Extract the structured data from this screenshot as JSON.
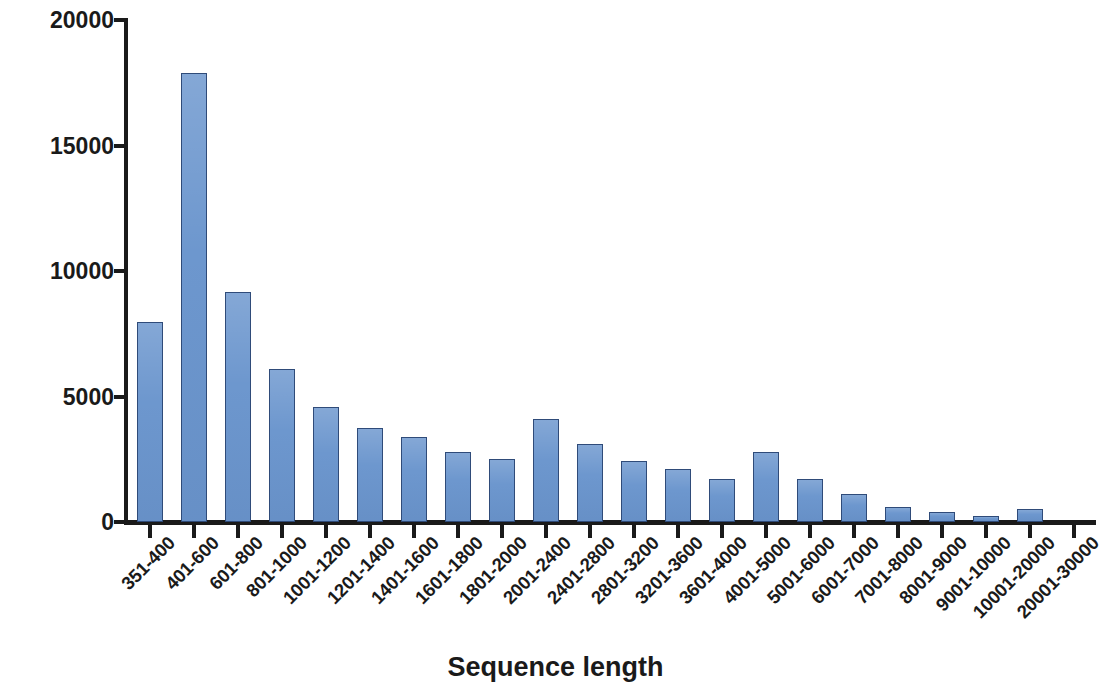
{
  "chart_data": {
    "type": "bar",
    "title": "",
    "xlabel": "Sequence length",
    "ylabel": "Sequence number",
    "ylim": [
      0,
      20000
    ],
    "yticks": [
      0,
      5000,
      10000,
      15000,
      20000
    ],
    "ytick_labels": [
      "0",
      "5000",
      "10000",
      "15000",
      "20000"
    ],
    "grid": false,
    "legend": false,
    "bar_color": "#6d97ce",
    "bar_edge_color": "#2f4b79",
    "axis_color": "#1a1a1a",
    "categories": [
      "351-400",
      "401-600",
      "601-800",
      "801-1000",
      "1001-1200",
      "1201-1400",
      "1401-1600",
      "1601-1800",
      "1801-2000",
      "2001-2400",
      "2401-2800",
      "2801-3200",
      "3201-3600",
      "3601-4000",
      "4001-5000",
      "5001-6000",
      "6001-7000",
      "7001-8000",
      "8001-9000",
      "9001-10000",
      "10001-20000",
      "20001-30000"
    ],
    "values": [
      7950,
      17900,
      9150,
      6100,
      4600,
      3750,
      3400,
      2800,
      2500,
      4100,
      3100,
      2450,
      2100,
      1700,
      2800,
      1700,
      1100,
      600,
      400,
      250,
      500,
      0
    ]
  }
}
